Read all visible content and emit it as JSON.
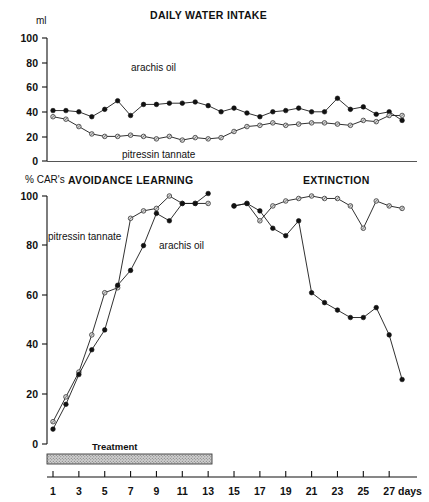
{
  "figure": {
    "width": 429,
    "height": 502,
    "background": "#ffffff",
    "ink_color": "#111111"
  },
  "top_panel": {
    "title": "DAILY WATER INTAKE",
    "y_unit": "ml",
    "y_ticks": [
      "100",
      "80",
      "60",
      "40",
      "20",
      "0"
    ],
    "series_labels": {
      "arachis_oil": "arachis oil",
      "pitressin_tannate": "pitressin tannate"
    }
  },
  "bottom_panel": {
    "title_left": "AVOIDANCE LEARNING",
    "title_right": "EXTINCTION",
    "y_unit": "% CAR's",
    "y_ticks": [
      "100",
      "80",
      "60",
      "40",
      "20",
      "0"
    ],
    "series_labels": {
      "pitressin_tannate": "pitressin tannate",
      "arachis_oil": "arachis oil"
    },
    "treatment_bar_label": "Treatment",
    "treatment_bar_span_days": [
      0.6,
      13.3
    ]
  },
  "x_axis": {
    "unit_label": "days",
    "ticks": [
      "1",
      "3",
      "5",
      "7",
      "9",
      "11",
      "13",
      "15",
      "17",
      "19",
      "21",
      "23",
      "25",
      "27"
    ],
    "tick_days": [
      1,
      3,
      5,
      7,
      9,
      11,
      13,
      15,
      17,
      19,
      21,
      23,
      25,
      27
    ]
  },
  "chart_data": [
    {
      "type": "line",
      "title": "DAILY WATER INTAKE",
      "xlabel": "days",
      "ylabel": "ml",
      "ylim": [
        0,
        100
      ],
      "xlim": [
        0.5,
        28
      ],
      "grid": false,
      "legend": "inline-annotations",
      "x": [
        1,
        2,
        3,
        4,
        5,
        6,
        7,
        8,
        9,
        10,
        11,
        12,
        13,
        14,
        15,
        16,
        17,
        18,
        19,
        20,
        21,
        22,
        23,
        24,
        25,
        26,
        27,
        28
      ],
      "series": [
        {
          "name": "arachis oil",
          "marker": "filled-circle",
          "values": [
            41,
            41,
            40,
            36,
            42,
            49,
            37,
            46,
            46,
            47,
            47,
            48,
            45,
            40,
            43,
            39,
            36,
            40,
            41,
            43,
            40,
            40,
            51,
            42,
            44,
            38,
            40,
            33
          ]
        },
        {
          "name": "pitressin tannate",
          "marker": "open-circle",
          "values": [
            36,
            34,
            28,
            22,
            20,
            20,
            21,
            20,
            18,
            20,
            17,
            19,
            18,
            19,
            24,
            28,
            29,
            31,
            29,
            30,
            31,
            31,
            30,
            29,
            33,
            32,
            37,
            37
          ]
        }
      ]
    },
    {
      "type": "line",
      "title": "AVOIDANCE LEARNING / EXTINCTION",
      "xlabel": "days",
      "ylabel": "% CAR's",
      "ylim": [
        0,
        100
      ],
      "xlim": [
        0.5,
        28
      ],
      "grid": false,
      "legend": "inline-annotations",
      "phases": [
        {
          "name": "AVOIDANCE LEARNING",
          "days": [
            1,
            13
          ]
        },
        {
          "name": "EXTINCTION",
          "days": [
            15,
            28
          ]
        }
      ],
      "series": [
        {
          "name": "pitressin tannate",
          "marker": "open-circle",
          "x": [
            1,
            2,
            3,
            4,
            5,
            6,
            7,
            8,
            9,
            10,
            11,
            12,
            13
          ],
          "values": [
            9,
            19,
            29,
            44,
            61,
            63,
            91,
            94,
            95,
            100,
            97,
            97,
            97
          ]
        },
        {
          "name": "pitressin tannate",
          "marker": "open-circle",
          "x": [
            15,
            16,
            17,
            18,
            19,
            20,
            21,
            22,
            23,
            24,
            25,
            26,
            27,
            28
          ],
          "values": [
            96,
            97,
            90,
            96,
            98,
            99,
            100,
            99,
            99,
            96,
            87,
            98,
            96,
            95
          ]
        },
        {
          "name": "arachis oil",
          "marker": "filled-circle",
          "x": [
            1,
            2,
            3,
            4,
            5,
            6,
            7,
            8,
            9,
            10,
            11,
            12,
            13
          ],
          "values": [
            6,
            16,
            28,
            38,
            46,
            64,
            70,
            80,
            93,
            90,
            97,
            97,
            101
          ]
        },
        {
          "name": "arachis oil",
          "marker": "filled-circle",
          "x": [
            15,
            16,
            17,
            18,
            19,
            20,
            21,
            22,
            23,
            24,
            25,
            26,
            27,
            28
          ],
          "values": [
            96,
            97,
            94,
            87,
            84,
            90,
            61,
            57,
            54,
            51,
            51,
            55,
            44,
            26
          ]
        }
      ]
    }
  ]
}
